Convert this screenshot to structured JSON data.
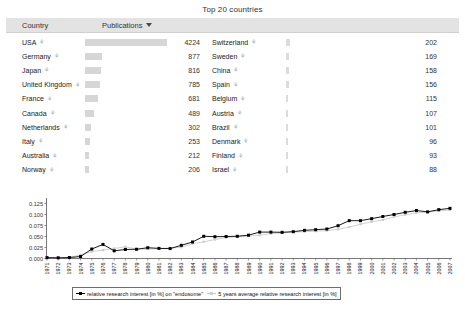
{
  "page": {
    "title": "Top 20 countries"
  },
  "table": {
    "headers": {
      "country": "Country",
      "publications": "Publications",
      "sort_icon": "caret-down-icon"
    },
    "max_value": 4224,
    "left_column": [
      {
        "country": "USA",
        "value": 4224
      },
      {
        "country": "Germany",
        "value": 877
      },
      {
        "country": "Japan",
        "value": 816
      },
      {
        "country": "United Kingdom",
        "value": 785
      },
      {
        "country": "France",
        "value": 681
      },
      {
        "country": "Canada",
        "value": 489
      },
      {
        "country": "Netherlands",
        "value": 302
      },
      {
        "country": "Italy",
        "value": 253
      },
      {
        "country": "Australia",
        "value": 212
      },
      {
        "country": "Norway",
        "value": 206
      }
    ],
    "right_column": [
      {
        "country": "Switzerland",
        "value": 202
      },
      {
        "country": "Sweden",
        "value": 169
      },
      {
        "country": "China",
        "value": 158
      },
      {
        "country": "Spain",
        "value": 156
      },
      {
        "country": "Belgium",
        "value": 115
      },
      {
        "country": "Austria",
        "value": 107
      },
      {
        "country": "Brazil",
        "value": 101
      },
      {
        "country": "Denmark",
        "value": 96
      },
      {
        "country": "Finland",
        "value": 93
      },
      {
        "country": "Israel",
        "value": 88
      }
    ]
  },
  "chart_data": {
    "type": "line",
    "title": "",
    "xlabel": "",
    "ylabel": "",
    "ylim": [
      0.0,
      0.1375
    ],
    "yticks": [
      0.0,
      0.025,
      0.05,
      0.075,
      0.1,
      0.125
    ],
    "ytick_labels": [
      "0.000",
      "0.025",
      "0.050",
      "0.075",
      "0.100",
      "0.125"
    ],
    "grid": false,
    "legend_position": "bottom",
    "x": [
      1971,
      1972,
      1973,
      1974,
      1975,
      1976,
      1977,
      1978,
      1979,
      1980,
      1981,
      1982,
      1983,
      1984,
      1985,
      1986,
      1987,
      1988,
      1989,
      1990,
      1991,
      1992,
      1993,
      1994,
      1995,
      1996,
      1997,
      1998,
      1999,
      2000,
      2001,
      2002,
      2003,
      2004,
      2005,
      2006,
      2007
    ],
    "series": [
      {
        "name": "relative research interest [in %] on \"endosome\"",
        "color": "#000000",
        "values": [
          0.002,
          0.0016,
          0.0022,
          0.0045,
          0.0215,
          0.032,
          0.0175,
          0.0205,
          0.021,
          0.0245,
          0.023,
          0.0225,
          0.03,
          0.0375,
          0.0505,
          0.0495,
          0.05,
          0.0505,
          0.053,
          0.06,
          0.06,
          0.0595,
          0.061,
          0.064,
          0.0655,
          0.067,
          0.0745,
          0.086,
          0.086,
          0.0905,
          0.0955,
          0.1,
          0.105,
          0.109,
          0.106,
          0.111,
          0.114
        ]
      },
      {
        "name": "5 years average relative research interest [in %]",
        "color": "#cccccc",
        "values": [
          null,
          null,
          0.0024,
          0.0084,
          0.0155,
          0.0192,
          0.0227,
          0.0265,
          0.0217,
          0.0213,
          0.0222,
          0.0241,
          0.0256,
          0.0335,
          0.0381,
          0.043,
          0.0475,
          0.0497,
          0.0507,
          0.0528,
          0.0567,
          0.058,
          0.0601,
          0.0609,
          0.062,
          0.0634,
          0.0664,
          0.0714,
          0.0778,
          0.0834,
          0.0876,
          0.0945,
          0.0994,
          0.104,
          0.1052,
          0.1082,
          0.11
        ]
      }
    ]
  }
}
